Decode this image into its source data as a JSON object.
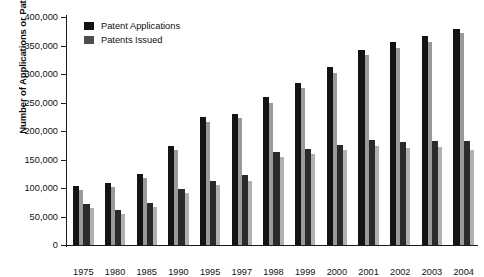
{
  "chart_data": {
    "type": "bar",
    "title": "",
    "xlabel": "",
    "ylabel": "Number of Applications or Patents",
    "ylim": [
      0,
      400000
    ],
    "ytick_labels": [
      "0",
      "50,000",
      "100,000",
      "150,000",
      "200,000",
      "250,000",
      "300,000",
      "350,000",
      "400,000"
    ],
    "ytick_values": [
      0,
      50000,
      100000,
      150000,
      200000,
      250000,
      300000,
      350000,
      400000
    ],
    "grid": false,
    "legend_position": "top-left",
    "categories": [
      "1975",
      "1980",
      "1985",
      "1990",
      "1995",
      "1997",
      "1998",
      "1999",
      "2000",
      "2001",
      "2002",
      "2003",
      "2004"
    ],
    "series": [
      {
        "name": "Patent Applications",
        "color": "#131313",
        "side_color": "#9a9a9a",
        "values": [
          103000,
          109000,
          124000,
          174000,
          224000,
          230000,
          259000,
          284000,
          312000,
          343000,
          356000,
          366000,
          379000
        ],
        "side_values": [
          96000,
          101000,
          117000,
          166000,
          216000,
          222000,
          250000,
          275000,
          302000,
          333000,
          346000,
          356000,
          372000
        ]
      },
      {
        "name": "Patents Issued",
        "color": "#2b2b2b",
        "side_color": "#b0b0b0",
        "values": [
          72000,
          62000,
          74000,
          99000,
          113000,
          122000,
          163000,
          169000,
          176000,
          184000,
          180000,
          182000,
          182000
        ],
        "side_values": [
          65000,
          54000,
          66000,
          91000,
          106000,
          113000,
          154000,
          160000,
          167000,
          174000,
          171000,
          172000,
          166000
        ]
      }
    ],
    "legend": [
      {
        "label": "Patent Applications",
        "swatch": "#131313"
      },
      {
        "label": "Patents Issued",
        "swatch": "#4d4d4d"
      }
    ]
  }
}
